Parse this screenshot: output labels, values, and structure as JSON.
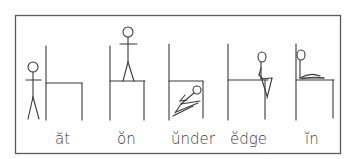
{
  "diagram": {
    "panels": [
      {
        "id": "at",
        "label": "ăt",
        "description": "figure standing at (beside) the chair"
      },
      {
        "id": "on",
        "label": "ŏn",
        "description": "figure standing on the chair seat"
      },
      {
        "id": "under",
        "label": "ŭnder",
        "description": "figure lying under the chair seat"
      },
      {
        "id": "edge",
        "label": "ĕdge",
        "description": "figure sitting on the edge of the chair"
      },
      {
        "id": "in",
        "label": "ĭn",
        "description": "figure lying in the chair"
      }
    ],
    "colors": {
      "line": "#3a3a3a",
      "frame": "#5a5a5a",
      "background": "#ffffff"
    }
  }
}
